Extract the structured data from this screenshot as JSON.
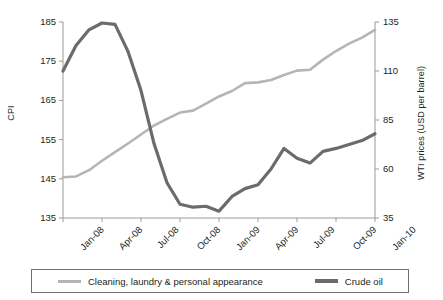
{
  "chart_data": {
    "type": "line",
    "title": "",
    "xlabel": "",
    "grid": false,
    "legend_position": "bottom",
    "x_tick_labels": [
      "Jan-08",
      "Apr-08",
      "Jul-08",
      "Oct-08",
      "Jan-09",
      "Apr-09",
      "Jul-09",
      "Oct-09",
      "Jan-10"
    ],
    "x_months": [
      "Jan-08",
      "Feb-08",
      "Mar-08",
      "Apr-08",
      "May-08",
      "Jun-08",
      "Jul-08",
      "Aug-08",
      "Sep-08",
      "Oct-08",
      "Nov-08",
      "Dec-08",
      "Jan-09",
      "Feb-09",
      "Mar-09",
      "Apr-09",
      "May-09",
      "Jun-09",
      "Jul-09",
      "Aug-09",
      "Sep-09",
      "Oct-09",
      "Nov-09",
      "Dec-09",
      "Jan-10"
    ],
    "axes": {
      "left": {
        "label": "CPI",
        "ticks": [
          135,
          145,
          155,
          165,
          175,
          185
        ],
        "ylim": [
          135,
          185
        ]
      },
      "right": {
        "label": "WTI prices (USD per barrel)",
        "ticks": [
          35,
          60,
          85,
          110,
          135
        ],
        "ylim": [
          35,
          135
        ]
      }
    },
    "series": [
      {
        "name": "Cleaning, laundry & personal appearance",
        "axis": "left",
        "color": "#b5b5b5",
        "line_width": 2.6,
        "values": [
          137.0,
          140.4,
          143.6,
          145.4,
          145.6,
          147.2,
          149.6,
          151.8,
          154.0,
          156.3,
          158.6,
          160.3,
          161.9,
          162.4,
          164.2,
          166.0,
          167.4,
          169.4,
          169.6,
          170.2,
          171.5,
          172.6,
          172.8,
          175.4,
          177.6
        ]
      },
      {
        "name": "Crude oil",
        "axis": "right",
        "color": "#6b6b6b",
        "line_width": 3.2,
        "values": [
          92.0,
          92.4,
          103.0,
          110.0,
          123.0,
          131.0,
          134.5,
          133.8,
          120.0,
          100.0,
          73.0,
          53.0,
          42.0,
          40.5,
          41.0,
          38.5,
          46.0,
          50.0,
          52.0,
          60.0,
          70.5,
          65.5,
          63.0,
          69.0,
          70.5
        ]
      }
    ],
    "series_extended": [
      {
        "name": "Cleaning, laundry & personal appearance",
        "axis": "left",
        "note": "tail continues to Jan-10",
        "tail_values": [
          179.5,
          181.0,
          183.0
        ]
      },
      {
        "name": "Crude oil",
        "axis": "right",
        "note": "tail continues to Jan-10",
        "tail_values": [
          72.5,
          74.5,
          78.0
        ]
      }
    ]
  },
  "legend": {
    "items": [
      {
        "label": "Cleaning, laundry & personal appearance",
        "color": "#b5b5b5"
      },
      {
        "label": "Crude oil",
        "color": "#6b6b6b"
      }
    ]
  }
}
